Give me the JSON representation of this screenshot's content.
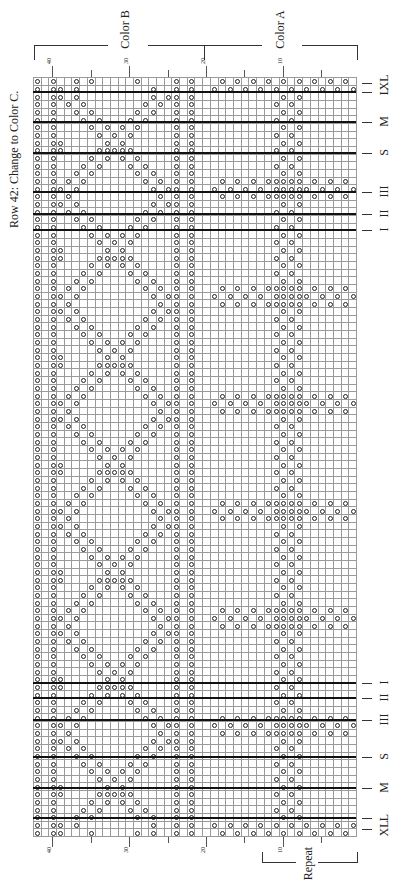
{
  "title": "Row 42: Change to Color C.",
  "color_labels": {
    "b": "Color B",
    "a": "Color A"
  },
  "repeat_label": "Repeat",
  "grid": {
    "cols": 42,
    "rows": 99,
    "left": 33,
    "top": 77,
    "cell": 7.69,
    "cell_h": 7.667
  },
  "column_numbers": [
    {
      "label": "40",
      "col": 40
    },
    {
      "label": "30",
      "col": 30
    },
    {
      "label": "20",
      "col": 20
    },
    {
      "label": "10",
      "col": 10
    }
  ],
  "minor_ticks": [
    35,
    25,
    15,
    5
  ],
  "size_lines_top": [
    {
      "label": "XL",
      "y": 83,
      "thick": false
    },
    {
      "label": "L",
      "y": 92,
      "thick": true
    },
    {
      "label": "M",
      "y": 122,
      "thick": true
    },
    {
      "label": "S",
      "y": 153,
      "thick": true
    },
    {
      "label": "III",
      "y": 192,
      "thick": true
    },
    {
      "label": "II",
      "y": 214,
      "thick": true
    },
    {
      "label": "I",
      "y": 230,
      "thick": true
    }
  ],
  "size_lines_bottom": [
    {
      "label": "I",
      "y": 683,
      "thick": true
    },
    {
      "label": "II",
      "y": 698,
      "thick": true
    },
    {
      "label": "III",
      "y": 720,
      "thick": true
    },
    {
      "label": "S",
      "y": 757,
      "thick": true
    },
    {
      "label": "M",
      "y": 788,
      "thick": true
    },
    {
      "label": "L",
      "y": 818,
      "thick": true
    },
    {
      "label": "XL",
      "y": 829,
      "thick": false
    }
  ],
  "band_rows": [
    13,
    27,
    41,
    55,
    69,
    83
  ],
  "edge_rows": {
    "top": [
      0,
      1
    ],
    "bottom": [
      97,
      98
    ]
  },
  "fixed_columns": [
    42,
    40,
    24,
    22
  ],
  "zigzag_columns": {
    "a": [
      11,
      9
    ],
    "b": [
      10,
      8
    ]
  },
  "lattice": {
    "col_from": 39,
    "col_to": 25,
    "period": 14
  }
}
